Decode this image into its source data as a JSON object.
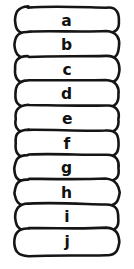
{
  "figure": {
    "style": "hand-drawn",
    "background_color": "#ffffff",
    "stroke_color": "#151515",
    "text_color": "#111111",
    "fill_color": "#ffffff",
    "canvas": {
      "width": 134,
      "height": 269
    }
  },
  "layout": {
    "pill_left": 15,
    "pill_right": 119,
    "pill_width": 104,
    "pill_height": 27,
    "pill_radius": 13.5,
    "first_pill_top": 7,
    "pill_pitch": 24.6,
    "letter_center_x": 67,
    "stroke_width": 2.6
  },
  "items": [
    {
      "index": 1,
      "label": "a",
      "name": "pill-a"
    },
    {
      "index": 2,
      "label": "b",
      "name": "pill-b"
    },
    {
      "index": 3,
      "label": "c",
      "name": "pill-c"
    },
    {
      "index": 4,
      "label": "d",
      "name": "pill-d"
    },
    {
      "index": 5,
      "label": "e",
      "name": "pill-e"
    },
    {
      "index": 6,
      "label": "f",
      "name": "pill-f"
    },
    {
      "index": 7,
      "label": "g",
      "name": "pill-g"
    },
    {
      "index": 8,
      "label": "h",
      "name": "pill-h"
    },
    {
      "index": 9,
      "label": "i",
      "name": "pill-i"
    },
    {
      "index": 10,
      "label": "j",
      "name": "pill-j"
    }
  ]
}
